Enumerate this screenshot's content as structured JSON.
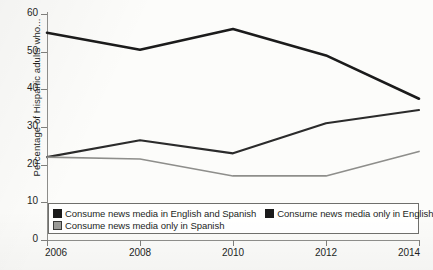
{
  "chart_data": {
    "type": "line",
    "title": "",
    "subtitle": "",
    "xlabel": "",
    "ylabel": "Percentage of Hispanic adults who...",
    "x": [
      2006,
      2008,
      2010,
      2012,
      2014
    ],
    "xtick_labels": [
      "2006",
      "2008",
      "2010",
      "2012",
      "2014"
    ],
    "ytick_labels": [
      "0",
      "10",
      "20",
      "30",
      "40",
      "50",
      "60"
    ],
    "ytick_values": [
      0,
      10,
      20,
      30,
      40,
      50,
      60
    ],
    "ylim": [
      0,
      60
    ],
    "xlim": [
      2006,
      2014
    ],
    "grid": false,
    "legend_position": "inside-bottom-left",
    "series": [
      {
        "name": "Consume news media in English and Spanish",
        "values": [
          55,
          50.5,
          56,
          49,
          37.5
        ],
        "color": "#1b1b1b",
        "marker_fill": "#1b1b1b",
        "marker_stroke": "#1b1b1b",
        "width": 2.6
      },
      {
        "name": "Consume news media only in English",
        "values": [
          22,
          26.5,
          23,
          31,
          34.5
        ],
        "color": "#2b2b2b",
        "marker_fill": "#1b1b1b",
        "marker_stroke": "#1b1b1b",
        "width": 2.1
      },
      {
        "name": "Consume news media only in Spanish",
        "values": [
          22,
          21.5,
          17,
          17,
          23.5
        ],
        "color": "#8e8e8b",
        "marker_fill": "#9a9a97",
        "marker_stroke": "#3a3a38",
        "width": 1.7
      }
    ]
  },
  "axis_colors": {
    "axis_line": "#8d8d8a",
    "tick": "#7e7e7b",
    "text": "#231f1d"
  }
}
